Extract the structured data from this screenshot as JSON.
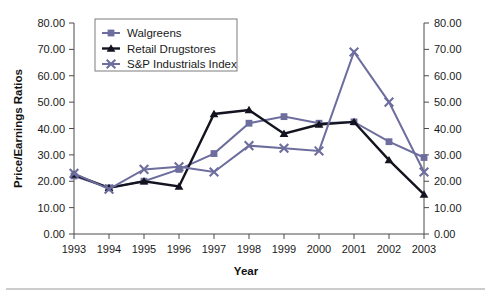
{
  "chart_data": {
    "type": "line",
    "title": "",
    "xlabel": "Year",
    "ylabel": "Price/Earnings Ratios",
    "categories": [
      "1993",
      "1994",
      "1995",
      "1996",
      "1997",
      "1998",
      "1999",
      "2000",
      "2001",
      "2002",
      "2003"
    ],
    "x": [
      1993,
      1994,
      1995,
      1996,
      1997,
      1998,
      1999,
      2000,
      2001,
      2002,
      2003
    ],
    "ylim": [
      0,
      80
    ],
    "y_ticks": [
      0,
      10,
      20,
      30,
      40,
      50,
      60,
      70,
      80
    ],
    "y_tick_labels": [
      "0.00",
      "10.00",
      "20.00",
      "30.00",
      "40.00",
      "50.00",
      "60.00",
      "70.00",
      "80.00"
    ],
    "y2lim": [
      0,
      80
    ],
    "y2_ticks": [
      0,
      10,
      20,
      30,
      40,
      50,
      60,
      70,
      80
    ],
    "y2_tick_labels": [
      "0.00",
      "10.00",
      "20.00",
      "30.00",
      "40.00",
      "50.00",
      "60.00",
      "70.00",
      "80.00"
    ],
    "grid": false,
    "legend_position": "top-left-inside",
    "series": [
      {
        "name": "Walgreens",
        "color": "#6d6d9e",
        "marker": "square",
        "values": [
          22.0,
          17.5,
          20.0,
          24.5,
          30.5,
          42.0,
          44.5,
          42.0,
          42.5,
          35.0,
          29.0
        ]
      },
      {
        "name": "Retail Drugstores",
        "color": "#141420",
        "marker": "triangle",
        "values": [
          22.5,
          17.5,
          20.0,
          18.0,
          45.5,
          47.0,
          38.0,
          41.5,
          42.5,
          28.0,
          15.0
        ]
      },
      {
        "name": "S&P Industrials Index",
        "color": "#6d6d9e",
        "marker": "cross",
        "values": [
          23.0,
          17.0,
          24.5,
          25.5,
          23.5,
          33.5,
          32.5,
          31.5,
          69.0,
          50.0,
          23.5
        ]
      }
    ]
  },
  "legend": {
    "items": [
      {
        "label": "Walgreens",
        "marker": "square-marker-icon"
      },
      {
        "label": "Retail Drugstores",
        "marker": "triangle-marker-icon"
      },
      {
        "label": "S&P Industrials Index",
        "marker": "cross-marker-icon"
      }
    ]
  },
  "colors": {
    "purple": "#6d6d9e",
    "black": "#141420",
    "axis": "#4a4a4a",
    "background": "#ffffff"
  }
}
